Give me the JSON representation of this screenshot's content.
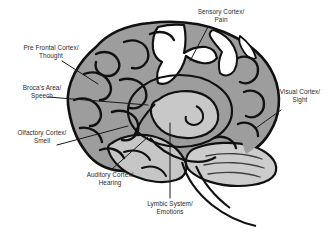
{
  "diagram": {
    "background_color": "#ffffff",
    "text_color": "#2b2b33",
    "outline_color": "#111111",
    "cortex_fill": "#9d9d9d",
    "cortex_fill_light": "#cfcfcf",
    "limbic_fill": "#c8c8c8",
    "cerebellum_fill": "#cccccc",
    "sensory_strip_fill": "#ffffff",
    "leader_line_color": "#1a1a1a"
  },
  "labels": {
    "sensory": {
      "line1": "Sensory Cortex/",
      "line2": "Pain"
    },
    "prefrontal": {
      "line1": "Pre Frontal Cortex/",
      "line2": "Thought"
    },
    "broca": {
      "line1": "Broca's Area/",
      "line2": "Speech"
    },
    "olfactory": {
      "line1": "Olfactory Cortex/",
      "line2": "Smell"
    },
    "auditory": {
      "line1": "Auditory Cortex/",
      "line2": "Hearing"
    },
    "lymbic": {
      "line1": "Lymbic System/",
      "line2": "Emotions"
    },
    "visual": {
      "line1": "Visual Cortex/",
      "line2": "Sight"
    }
  },
  "regions": [
    {
      "name": "sensory-cortex",
      "function": "Pain"
    },
    {
      "name": "pre-frontal-cortex",
      "function": "Thought"
    },
    {
      "name": "brocas-area",
      "function": "Speech"
    },
    {
      "name": "olfactory-cortex",
      "function": "Smell"
    },
    {
      "name": "auditory-cortex",
      "function": "Hearing"
    },
    {
      "name": "lymbic-system",
      "function": "Emotions"
    },
    {
      "name": "visual-cortex",
      "function": "Sight"
    }
  ]
}
